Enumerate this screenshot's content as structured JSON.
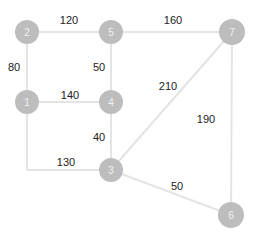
{
  "diagram": {
    "type": "weighted-graph",
    "colors": {
      "node_fill": "#bdbdbd",
      "node_text": "#f2f2f2",
      "edge": "#e4e4e4",
      "edge_label": "#222222"
    },
    "nodes": [
      {
        "id": "1",
        "label": "1",
        "x": 27,
        "y": 102
      },
      {
        "id": "2",
        "label": "2",
        "x": 27,
        "y": 32
      },
      {
        "id": "3",
        "label": "3",
        "x": 111,
        "y": 170
      },
      {
        "id": "4",
        "label": "4",
        "x": 111,
        "y": 102
      },
      {
        "id": "5",
        "label": "5",
        "x": 111,
        "y": 32
      },
      {
        "id": "6",
        "label": "6",
        "x": 231,
        "y": 215
      },
      {
        "id": "7",
        "label": "7",
        "x": 232,
        "y": 32
      }
    ],
    "edges": [
      {
        "from": "2",
        "to": "5",
        "weight": "120",
        "label_x": 69,
        "label_y": 20
      },
      {
        "from": "5",
        "to": "7",
        "weight": "160",
        "label_x": 173,
        "label_y": 20
      },
      {
        "from": "2",
        "to": "1",
        "weight": "80",
        "label_x": 14,
        "label_y": 67
      },
      {
        "from": "5",
        "to": "4",
        "weight": "50",
        "label_x": 99,
        "label_y": 67
      },
      {
        "from": "1",
        "to": "4",
        "weight": "140",
        "label_x": 70,
        "label_y": 95
      },
      {
        "from": "7",
        "to": "3",
        "weight": "210",
        "label_x": 168,
        "label_y": 86
      },
      {
        "from": "4",
        "to": "3",
        "weight": "40",
        "label_x": 99,
        "label_y": 137
      },
      {
        "from": "1",
        "to": "3",
        "weight": "130",
        "label_x": 66,
        "label_y": 162
      },
      {
        "from": "7",
        "to": "6",
        "weight": "190",
        "label_x": 206,
        "label_y": 119
      },
      {
        "from": "3",
        "to": "6",
        "weight": "50",
        "label_x": 177,
        "label_y": 186
      }
    ]
  }
}
